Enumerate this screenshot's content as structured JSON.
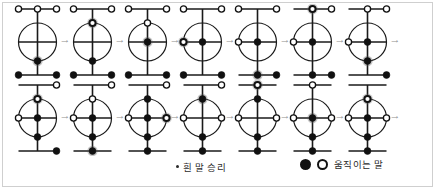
{
  "figure": {
    "title": "",
    "colors": {
      "line": "#1a1a1a",
      "black_piece": "#111111",
      "white_piece_fill": "#ffffff",
      "white_piece_stroke": "#111111",
      "arrow": "#8e8e8e",
      "frame": "#cfcfcf"
    },
    "arrow_glyph": "→",
    "board": {
      "node_names": [
        "top-left",
        "top-center",
        "top-right",
        "circle-top",
        "circle-left",
        "center",
        "circle-right",
        "circle-bottom",
        "bottom-left",
        "bottom-center",
        "bottom-right"
      ]
    },
    "rows": [
      {
        "row_index": 0,
        "boards": [
          {
            "step": 1,
            "pieces": {
              "top-left": "white",
              "top-center": "white",
              "top-right": "white",
              "circle-top": "none",
              "circle-left": "none",
              "center": "none",
              "circle-right": "none",
              "circle-bottom": "black",
              "bottom-left": "black",
              "bottom-center": "none",
              "bottom-right": "black"
            },
            "moving": [
              "circle-bottom"
            ]
          },
          {
            "step": 2,
            "pieces": {
              "top-left": "white",
              "top-center": "none",
              "top-right": "white",
              "circle-top": "white",
              "circle-left": "none",
              "center": "none",
              "circle-right": "none",
              "circle-bottom": "black",
              "bottom-left": "black",
              "bottom-center": "none",
              "bottom-right": "black"
            },
            "moving": [
              "circle-top"
            ]
          },
          {
            "step": 3,
            "pieces": {
              "top-left": "white",
              "top-center": "none",
              "top-right": "white",
              "circle-top": "white",
              "circle-left": "none",
              "center": "black",
              "circle-right": "none",
              "circle-bottom": "none",
              "bottom-left": "black",
              "bottom-center": "none",
              "bottom-right": "black"
            },
            "moving": [
              "center"
            ]
          },
          {
            "step": 4,
            "pieces": {
              "top-left": "white",
              "top-center": "none",
              "top-right": "white",
              "circle-top": "none",
              "circle-left": "white",
              "center": "black",
              "circle-right": "none",
              "circle-bottom": "none",
              "bottom-left": "black",
              "bottom-center": "none",
              "bottom-right": "black"
            },
            "moving": [
              "circle-left"
            ]
          },
          {
            "step": 5,
            "pieces": {
              "top-left": "white",
              "top-center": "none",
              "top-right": "white",
              "circle-top": "none",
              "circle-left": "white",
              "center": "black",
              "circle-right": "none",
              "circle-bottom": "none",
              "bottom-left": "none",
              "bottom-center": "black",
              "bottom-right": "black"
            },
            "moving": [
              "bottom-center"
            ]
          },
          {
            "step": 6,
            "pieces": {
              "top-left": "none",
              "top-center": "white",
              "top-right": "white",
              "circle-top": "none",
              "circle-left": "white",
              "center": "black",
              "circle-right": "none",
              "circle-bottom": "none",
              "bottom-left": "none",
              "bottom-center": "black",
              "bottom-right": "black"
            },
            "moving": [
              "top-center"
            ]
          },
          {
            "step": 7,
            "pieces": {
              "top-left": "none",
              "top-center": "white",
              "top-right": "white",
              "circle-top": "none",
              "circle-left": "white",
              "center": "black",
              "circle-right": "none",
              "circle-bottom": "black",
              "bottom-left": "none",
              "bottom-center": "none",
              "bottom-right": "black"
            },
            "moving": [
              "circle-bottom"
            ]
          }
        ]
      },
      {
        "row_index": 1,
        "boards": [
          {
            "step": 8,
            "pieces": {
              "top-left": "none",
              "top-center": "none",
              "top-right": "white",
              "circle-top": "white",
              "circle-left": "white",
              "center": "black",
              "circle-right": "none",
              "circle-bottom": "black",
              "bottom-left": "none",
              "bottom-center": "none",
              "bottom-right": "black"
            },
            "moving": [
              "circle-top"
            ]
          },
          {
            "step": 9,
            "pieces": {
              "top-left": "none",
              "top-center": "none",
              "top-right": "white",
              "circle-top": "white",
              "circle-left": "white",
              "center": "black",
              "circle-right": "none",
              "circle-bottom": "black",
              "bottom-left": "none",
              "bottom-center": "black",
              "bottom-right": "none"
            },
            "moving": [
              "bottom-center"
            ]
          },
          {
            "step": 10,
            "pieces": {
              "top-left": "none",
              "top-center": "none",
              "top-right": "white",
              "circle-top": "black",
              "circle-left": "white",
              "center": "black",
              "circle-right": "white",
              "circle-bottom": "black",
              "bottom-left": "none",
              "bottom-center": "black",
              "bottom-right": "none"
            },
            "moving": [
              "circle-right"
            ]
          },
          {
            "step": 11,
            "pieces": {
              "top-left": "none",
              "top-center": "none",
              "top-right": "white",
              "circle-top": "black",
              "circle-left": "white",
              "center": "none",
              "circle-right": "white",
              "circle-bottom": "black",
              "bottom-left": "none",
              "bottom-center": "black",
              "bottom-right": "none"
            },
            "moving": [
              "circle-top"
            ]
          },
          {
            "step": 12,
            "pieces": {
              "top-left": "none",
              "top-center": "white",
              "top-right": "none",
              "circle-top": "black",
              "circle-left": "white",
              "center": "none",
              "circle-right": "white",
              "circle-bottom": "black",
              "bottom-left": "none",
              "bottom-center": "black",
              "bottom-right": "none"
            },
            "moving": [
              "top-center"
            ]
          },
          {
            "step": 13,
            "pieces": {
              "top-left": "none",
              "top-center": "white",
              "top-right": "none",
              "circle-top": "none",
              "circle-left": "white",
              "center": "black",
              "circle-right": "white",
              "circle-bottom": "black",
              "bottom-left": "none",
              "bottom-center": "black",
              "bottom-right": "none"
            },
            "moving": [
              "center"
            ]
          },
          {
            "step": 14,
            "pieces": {
              "top-left": "none",
              "top-center": "none",
              "top-right": "none",
              "circle-top": "white",
              "circle-left": "white",
              "center": "black",
              "circle-right": "white",
              "circle-bottom": "black",
              "bottom-left": "none",
              "bottom-center": "black",
              "bottom-right": "none"
            },
            "moving": [
              "circle-top"
            ]
          }
        ]
      }
    ]
  },
  "legend": {
    "win_note": "흰 말 승리",
    "moving_note": "움직이는 말"
  }
}
